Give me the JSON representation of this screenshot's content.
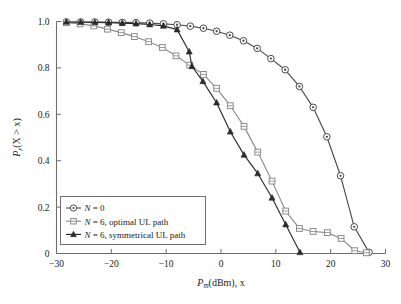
{
  "chart_data": {
    "type": "line",
    "title": "",
    "xlabel": "P_m(dBm), x",
    "xlabel_main": "P",
    "xlabel_sub": "m",
    "xlabel_rest": "(dBm), x",
    "ylabel": "P_r(X > x)",
    "ylabel_main": "P",
    "ylabel_sub": "r",
    "ylabel_rest": "(X > x)",
    "xlim": [
      -30,
      30
    ],
    "ylim": [
      0,
      1
    ],
    "xticks": [
      -30,
      -20,
      -10,
      0,
      10,
      20,
      30
    ],
    "xticklabels": [
      "-30",
      "-20",
      "-10",
      "0",
      "10",
      "20",
      "30"
    ],
    "yticks": [
      0,
      0.2,
      0.4,
      0.6,
      0.8,
      1.0
    ],
    "yticklabels": [
      "0",
      "0.2",
      "0.4",
      "0.6",
      "0.8",
      "1.0"
    ],
    "grid": false,
    "legend_position": "lower left",
    "series": [
      {
        "name": "N = 0",
        "label_prefix": "N",
        "label_rest": " = 0",
        "marker": "circle-dot",
        "color": "#4a4a4a",
        "points": [
          {
            "x": -28.2,
            "y": 0.998
          },
          {
            "x": -25.6,
            "y": 0.998
          },
          {
            "x": -23.0,
            "y": 0.998
          },
          {
            "x": -20.5,
            "y": 0.997
          },
          {
            "x": -18.0,
            "y": 0.996
          },
          {
            "x": -15.5,
            "y": 0.995
          },
          {
            "x": -13.0,
            "y": 0.993
          },
          {
            "x": -10.5,
            "y": 0.99
          },
          {
            "x": -8.0,
            "y": 0.986
          },
          {
            "x": -5.6,
            "y": 0.98
          },
          {
            "x": -3.2,
            "y": 0.971
          },
          {
            "x": -0.8,
            "y": 0.958
          },
          {
            "x": 1.6,
            "y": 0.941
          },
          {
            "x": 4.1,
            "y": 0.917
          },
          {
            "x": 6.6,
            "y": 0.884
          },
          {
            "x": 9.1,
            "y": 0.84
          },
          {
            "x": 11.7,
            "y": 0.792
          },
          {
            "x": 14.3,
            "y": 0.72
          },
          {
            "x": 16.8,
            "y": 0.63
          },
          {
            "x": 19.3,
            "y": 0.503
          },
          {
            "x": 21.8,
            "y": 0.335
          },
          {
            "x": 24.3,
            "y": 0.115
          },
          {
            "x": 27.0,
            "y": 0.005
          }
        ]
      },
      {
        "name": "N = 6, optimal UL path",
        "label_prefix": "N",
        "label_rest": " = 6, optimal UL path",
        "marker": "square-open",
        "color": "#8c8c8c",
        "points": [
          {
            "x": -28.2,
            "y": 0.995
          },
          {
            "x": -25.7,
            "y": 0.99
          },
          {
            "x": -23.2,
            "y": 0.981
          },
          {
            "x": -20.7,
            "y": 0.967
          },
          {
            "x": -18.2,
            "y": 0.952
          },
          {
            "x": -15.8,
            "y": 0.935
          },
          {
            "x": -13.2,
            "y": 0.913
          },
          {
            "x": -10.7,
            "y": 0.888
          },
          {
            "x": -8.2,
            "y": 0.852
          },
          {
            "x": -5.7,
            "y": 0.812
          },
          {
            "x": -3.2,
            "y": 0.772
          },
          {
            "x": -0.8,
            "y": 0.712
          },
          {
            "x": 1.7,
            "y": 0.637
          },
          {
            "x": 4.2,
            "y": 0.548
          },
          {
            "x": 6.7,
            "y": 0.437
          },
          {
            "x": 9.3,
            "y": 0.312
          },
          {
            "x": 11.8,
            "y": 0.183
          },
          {
            "x": 14.3,
            "y": 0.108
          },
          {
            "x": 16.8,
            "y": 0.095
          },
          {
            "x": 19.4,
            "y": 0.09
          },
          {
            "x": 21.9,
            "y": 0.065
          },
          {
            "x": 24.4,
            "y": 0.012
          },
          {
            "x": 26.5,
            "y": 0.003
          }
        ]
      },
      {
        "name": "N = 6, symmetrical UL path",
        "label_prefix": "N",
        "label_rest": " = 6, symmetrical UL path",
        "marker": "triangle-filled",
        "color": "#2b2b2b",
        "points": [
          {
            "x": -28.2,
            "y": 0.998
          },
          {
            "x": -25.6,
            "y": 0.997
          },
          {
            "x": -23.0,
            "y": 0.996
          },
          {
            "x": -20.5,
            "y": 0.995
          },
          {
            "x": -18.0,
            "y": 0.993
          },
          {
            "x": -15.5,
            "y": 0.991
          },
          {
            "x": -13.0,
            "y": 0.987
          },
          {
            "x": -10.5,
            "y": 0.981
          },
          {
            "x": -8.0,
            "y": 0.965
          },
          {
            "x": -5.8,
            "y": 0.87
          },
          {
            "x": -5.3,
            "y": 0.807
          },
          {
            "x": -3.3,
            "y": 0.742
          },
          {
            "x": -0.8,
            "y": 0.65
          },
          {
            "x": 1.7,
            "y": 0.525
          },
          {
            "x": 4.2,
            "y": 0.425
          },
          {
            "x": 6.7,
            "y": 0.345
          },
          {
            "x": 9.3,
            "y": 0.24
          },
          {
            "x": 11.8,
            "y": 0.125
          },
          {
            "x": 14.4,
            "y": 0.005
          }
        ]
      }
    ]
  }
}
